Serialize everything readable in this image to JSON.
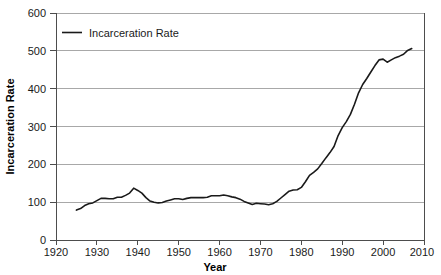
{
  "chart_data": {
    "type": "line",
    "title": "",
    "xlabel": "Year",
    "ylabel": "Incarceration Rate",
    "xlim": [
      1920,
      2010
    ],
    "ylim": [
      0,
      600
    ],
    "xticks": [
      1920,
      1930,
      1940,
      1950,
      1960,
      1970,
      1980,
      1990,
      2000,
      2010
    ],
    "yticks": [
      0,
      100,
      200,
      300,
      400,
      500,
      600
    ],
    "grid": "horizontal",
    "legend_position": "top-left",
    "series": [
      {
        "name": "Incarceration Rate",
        "color": "#1a1a1a",
        "x": [
          1925,
          1926,
          1927,
          1928,
          1929,
          1930,
          1931,
          1932,
          1933,
          1934,
          1935,
          1936,
          1937,
          1938,
          1939,
          1940,
          1941,
          1942,
          1943,
          1944,
          1945,
          1946,
          1947,
          1948,
          1949,
          1950,
          1951,
          1952,
          1953,
          1954,
          1955,
          1956,
          1957,
          1958,
          1959,
          1960,
          1961,
          1962,
          1963,
          1964,
          1965,
          1966,
          1967,
          1968,
          1969,
          1970,
          1971,
          1972,
          1973,
          1974,
          1975,
          1976,
          1977,
          1978,
          1979,
          1980,
          1981,
          1982,
          1983,
          1984,
          1985,
          1986,
          1987,
          1988,
          1989,
          1990,
          1991,
          1992,
          1993,
          1994,
          1995,
          1996,
          1997,
          1998,
          1999,
          2000,
          2001,
          2002,
          2003,
          2004,
          2005,
          2006,
          2007
        ],
        "values": [
          79,
          83,
          91,
          96,
          98,
          104,
          110,
          110,
          109,
          109,
          113,
          113,
          118,
          124,
          137,
          131,
          124,
          112,
          103,
          100,
          98,
          99,
          103,
          106,
          109,
          109,
          107,
          110,
          112,
          112,
          112,
          112,
          113,
          117,
          117,
          117,
          119,
          117,
          114,
          112,
          108,
          102,
          98,
          94,
          97,
          96,
          95,
          93,
          96,
          102,
          111,
          120,
          129,
          132,
          133,
          139,
          154,
          171,
          179,
          188,
          202,
          217,
          231,
          247,
          276,
          297,
          313,
          332,
          359,
          389,
          411,
          427,
          444,
          461,
          476,
          478,
          470,
          476,
          482,
          486,
          491,
          501,
          506
        ],
        "units_note": "prisoners per 100,000 population"
      }
    ],
    "annotations": {
      "series_start_year": 1925,
      "series_end_year": 2007,
      "peak_value": 506,
      "peak_year": 2007,
      "minimum_value": 79,
      "minimum_year": 1925,
      "local_peak_1939": 137,
      "trough_1972": 93
    }
  },
  "legend": {
    "entries": [
      {
        "label": "Incarceration Rate",
        "color": "#1a1a1a"
      }
    ]
  },
  "axes": {
    "x": {
      "title": "Year",
      "ticks": [
        "1920",
        "1930",
        "1940",
        "1950",
        "1960",
        "1970",
        "1980",
        "1990",
        "2000",
        "2010"
      ]
    },
    "y": {
      "title": "Incarceration Rate",
      "ticks": [
        "0",
        "100",
        "200",
        "300",
        "400",
        "500",
        "600"
      ]
    }
  },
  "colors": {
    "line": "#1a1a1a",
    "grid": "#a8a8a8",
    "axis": "#4d4d4d",
    "background": "#ffffff",
    "text": "#1a1a1a"
  }
}
